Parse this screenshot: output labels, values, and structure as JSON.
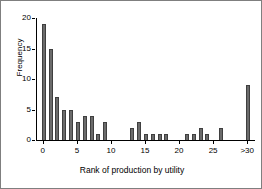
{
  "chart_data": {
    "type": "bar",
    "title": "",
    "xlabel": "Rank of production by utility",
    "ylabel": "Frequency",
    "xlim": [
      -1,
      31
    ],
    "ylim": [
      0,
      20
    ],
    "grid": false,
    "legend": null,
    "xtick_labels": [
      "0",
      "5",
      "10",
      "15",
      "20",
      "25",
      ">30"
    ],
    "xtick_values": [
      0,
      5,
      10,
      15,
      20,
      25,
      30
    ],
    "ytick_labels": [
      "0",
      "5",
      "10",
      "15",
      "20"
    ],
    "ytick_values": [
      0,
      5,
      10,
      15,
      20
    ],
    "categories": [
      0,
      1,
      2,
      3,
      4,
      5,
      6,
      7,
      8,
      9,
      10,
      11,
      12,
      13,
      14,
      15,
      16,
      17,
      18,
      19,
      20,
      21,
      22,
      23,
      24,
      25,
      26,
      27,
      28,
      29,
      30
    ],
    "values": [
      19,
      15,
      7,
      5,
      5,
      3,
      4,
      4,
      1,
      3,
      0,
      0,
      0,
      2,
      3,
      1,
      1,
      1,
      1,
      0,
      0,
      1,
      1,
      2,
      1,
      0,
      2,
      0,
      0,
      0,
      9
    ],
    "bar_color": "#6b6b6b",
    "bar_edge_color": "#3f3f3f",
    "axis_color": "#000000",
    "background_color": "#ffffff",
    "border_color": "#7f7f7f"
  }
}
